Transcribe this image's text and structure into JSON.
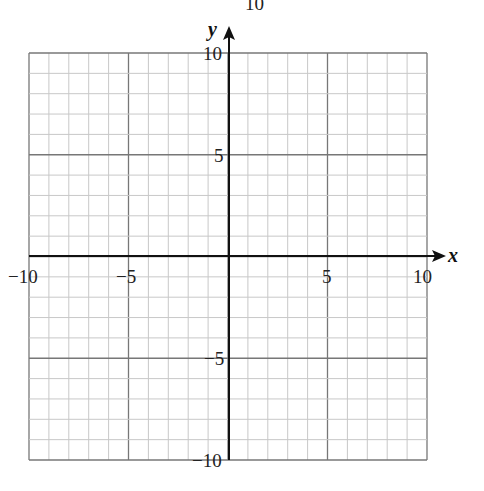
{
  "header_fragment": "y = 10",
  "chart_data": {
    "type": "scatter",
    "title": "",
    "xlabel": "x",
    "ylabel": "y",
    "xlim": [
      -10,
      10
    ],
    "ylim": [
      -10,
      10
    ],
    "grid": true,
    "grid_minor_step": 1,
    "grid_major_step": 5,
    "x_ticks": [
      "-10",
      "-5",
      "5",
      "10"
    ],
    "y_ticks": [
      "10",
      "5",
      "-5",
      "-10"
    ],
    "series": []
  },
  "labels": {
    "x_axis": "x",
    "y_axis": "y",
    "xt_m10": "−10",
    "xt_m5": "−5",
    "xt_5": "5",
    "xt_10": "10",
    "yt_10": "10",
    "yt_5": "5",
    "yt_m5": "−5",
    "yt_m10": "−10",
    "top_fragment": "10"
  },
  "colors": {
    "minor": "#c8c8c8",
    "major": "#777777",
    "axis": "#111111"
  }
}
